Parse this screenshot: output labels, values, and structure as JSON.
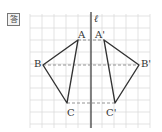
{
  "badge": {
    "label": "答"
  },
  "axis": {
    "label": "ℓ"
  },
  "points": {
    "A": "A",
    "B": "B",
    "C": "C",
    "A_prime": "A'",
    "B_prime": "B'",
    "C_prime": "C'"
  },
  "colors": {
    "grid": "#dcdcdc",
    "shape": "#333333",
    "dashed": "#888888"
  }
}
